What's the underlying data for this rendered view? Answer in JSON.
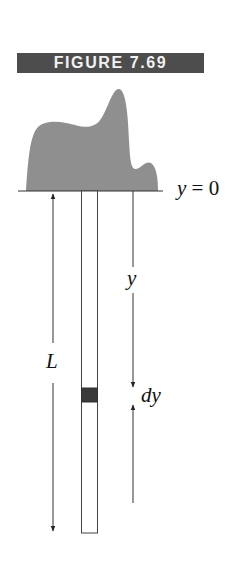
{
  "figure": {
    "title": "FIGURE 7.69"
  },
  "labels": {
    "baseline_var": "y",
    "baseline_eq": "= 0",
    "depth": "y",
    "length": "L",
    "element": "dy"
  },
  "colors": {
    "banner_bg": "#4d4d4d",
    "banner_text": "#f2f2f2",
    "terrain_fill": "#8f8f8f",
    "element_fill": "#3a3a3a",
    "line": "#333333"
  }
}
